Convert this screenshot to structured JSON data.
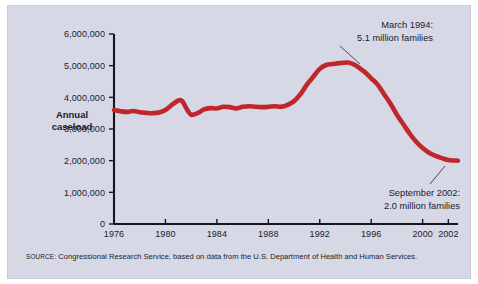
{
  "figure": {
    "background_color": "#d6d8e6",
    "page_color": "#ffffff",
    "line_color": "#c0272d",
    "axis_color": "#15151f",
    "text_color": "#1b1b2a"
  },
  "axis_label": {
    "line1": "Annual",
    "line2": "caseload"
  },
  "annotations": {
    "peak": {
      "line1": "March 1994:",
      "line2": "5.1 million families"
    },
    "end": {
      "line1": "September 2002:",
      "line2": "2.0 million families"
    }
  },
  "source": {
    "label": "SOURCE:",
    "text": " Congressional Research Service, based on data from the U.S. Department of Health and Human Services."
  },
  "chart_data": {
    "type": "line",
    "title": "",
    "subtitle": "",
    "xlabel": "",
    "ylabel": "Annual caseload",
    "xlim": [
      1976,
      2002.75
    ],
    "ylim": [
      0,
      6000000
    ],
    "grid": false,
    "legend": null,
    "xticks": [
      1976,
      1980,
      1984,
      1988,
      1992,
      1996,
      2000,
      2002
    ],
    "xticklabels": [
      "1976",
      "1980",
      "1984",
      "1988",
      "1992",
      "1996",
      "2000",
      "2002"
    ],
    "yticks": [
      0,
      1000000,
      2000000,
      3000000,
      4000000,
      5000000,
      6000000
    ],
    "yticklabels": [
      "0",
      "1,000,000",
      "2,000,000",
      "3,000,000",
      "4,000,000",
      "5,000,000",
      "6,000,000"
    ],
    "series": [
      {
        "name": "Annual caseload",
        "color": "#c0272d",
        "x": [
          1976,
          1976.5,
          1977,
          1977.5,
          1978,
          1978.5,
          1979,
          1979.5,
          1980,
          1980.5,
          1981,
          1981.3,
          1981.7,
          1982,
          1982.5,
          1983,
          1983.5,
          1984,
          1984.5,
          1985,
          1985.5,
          1986,
          1986.5,
          1987,
          1987.5,
          1988,
          1988.5,
          1989,
          1989.5,
          1990,
          1990.5,
          1991,
          1991.5,
          1992,
          1992.5,
          1993,
          1993.5,
          1994.2,
          1994.7,
          1995,
          1995.5,
          1996,
          1996.5,
          1997,
          1997.5,
          1998,
          1998.5,
          1999,
          1999.5,
          2000,
          2000.5,
          2001,
          2001.5,
          2002,
          2002.75
        ],
        "y": [
          3600000,
          3560000,
          3540000,
          3570000,
          3530000,
          3510000,
          3500000,
          3520000,
          3600000,
          3760000,
          3900000,
          3880000,
          3600000,
          3450000,
          3500000,
          3620000,
          3660000,
          3650000,
          3700000,
          3690000,
          3650000,
          3700000,
          3720000,
          3700000,
          3690000,
          3700000,
          3720000,
          3700000,
          3760000,
          3880000,
          4100000,
          4400000,
          4650000,
          4900000,
          5020000,
          5050000,
          5080000,
          5100000,
          5030000,
          4950000,
          4800000,
          4600000,
          4400000,
          4100000,
          3800000,
          3450000,
          3150000,
          2850000,
          2600000,
          2400000,
          2250000,
          2150000,
          2080000,
          2020000,
          2000000
        ]
      }
    ],
    "annotations": [
      {
        "label": "March 1994: 5.1 million families",
        "x": 1994.2,
        "y": 5100000
      },
      {
        "label": "September 2002: 2.0 million families",
        "x": 2002.75,
        "y": 2000000
      }
    ]
  }
}
